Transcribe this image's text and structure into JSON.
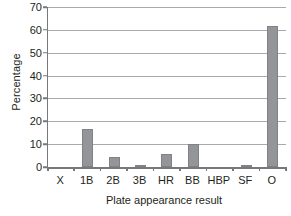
{
  "chart_data": {
    "type": "bar",
    "title": "",
    "xlabel": "Plate appearance result",
    "ylabel": "Percentage",
    "categories": [
      "X",
      "1B",
      "2B",
      "3B",
      "HR",
      "BB",
      "HBP",
      "SF",
      "O"
    ],
    "values": [
      0,
      16.5,
      4.5,
      0.6,
      5.5,
      10.2,
      0,
      0.8,
      61.5
    ],
    "ylim": [
      0,
      70
    ],
    "ytick_step": 10,
    "yticks": [
      0,
      10,
      20,
      30,
      40,
      50,
      60,
      70
    ],
    "ytick_labels": [
      "0",
      "10",
      "20",
      "30",
      "40",
      "50",
      "60",
      "70"
    ],
    "grid": true,
    "grid_axis": "y",
    "legend": false,
    "legend_position": "none",
    "bar_color": "#939598",
    "axis_color": "#77787b",
    "grid_color": "#a7a9ac",
    "series": [
      {
        "name": "Percentage",
        "values": [
          0,
          16.5,
          4.5,
          0.6,
          5.5,
          10.2,
          0,
          0.8,
          61.5
        ]
      }
    ]
  }
}
